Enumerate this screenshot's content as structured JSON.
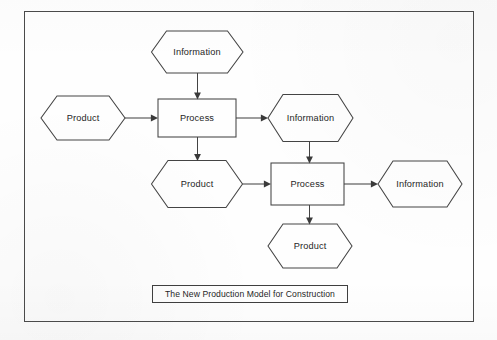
{
  "diagram": {
    "title": "The New Production Model for Construction",
    "type": "flowchart",
    "frame": {
      "stroke_color": "#4a4a4a"
    },
    "shape_legend": {
      "hexagon": "resource / artifact",
      "rectangle": "process"
    },
    "colors": {
      "stroke": "#444444",
      "text": "#262626",
      "background": "#fefefe"
    },
    "nodes": [
      {
        "id": "info-top",
        "label": "Information",
        "shape": "hexagon",
        "x": 197,
        "y": 52
      },
      {
        "id": "product-left",
        "label": "Product",
        "shape": "hexagon",
        "x": 83,
        "y": 118
      },
      {
        "id": "process-1",
        "label": "Process",
        "shape": "rectangle",
        "x": 197,
        "y": 118
      },
      {
        "id": "info-mid",
        "label": "Information",
        "shape": "hexagon",
        "x": 310,
        "y": 118
      },
      {
        "id": "product-mid",
        "label": "Product",
        "shape": "hexagon",
        "x": 197,
        "y": 184
      },
      {
        "id": "process-2",
        "label": "Process",
        "shape": "rectangle",
        "x": 308,
        "y": 184
      },
      {
        "id": "info-right",
        "label": "Information",
        "shape": "hexagon",
        "x": 420,
        "y": 184
      },
      {
        "id": "product-bot",
        "label": "Product",
        "shape": "hexagon",
        "x": 310,
        "y": 246
      }
    ],
    "edges": [
      {
        "from": "info-top",
        "to": "process-1",
        "direction": "down"
      },
      {
        "from": "product-left",
        "to": "process-1",
        "direction": "right"
      },
      {
        "from": "process-1",
        "to": "info-mid",
        "direction": "right"
      },
      {
        "from": "process-1",
        "to": "product-mid",
        "direction": "down"
      },
      {
        "from": "info-mid",
        "to": "process-2",
        "direction": "down"
      },
      {
        "from": "product-mid",
        "to": "process-2",
        "direction": "right"
      },
      {
        "from": "process-2",
        "to": "info-right",
        "direction": "right"
      },
      {
        "from": "process-2",
        "to": "product-bot",
        "direction": "down"
      }
    ],
    "labels": {
      "info_top": "Information",
      "product_left": "Product",
      "process_1": "Process",
      "info_mid": "Information",
      "product_mid": "Product",
      "process_2": "Process",
      "info_right": "Information",
      "product_bot": "Product"
    }
  }
}
